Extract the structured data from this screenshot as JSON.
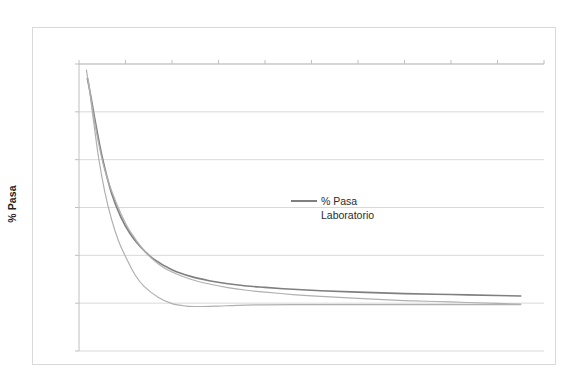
{
  "chart_data": {
    "type": "line",
    "title": "",
    "xlabel": "Diametro Tamiz (mm)",
    "ylabel": "% Pasa",
    "xlim": [
      0,
      10
    ],
    "ylim": [
      0,
      120
    ],
    "y_axis_inverted": true,
    "x_axis_position": "top",
    "grid": "horizontal",
    "legend_position": "center",
    "xticks": [
      "0",
      "1",
      "2",
      "3",
      "4",
      "5",
      "6",
      "7",
      "8",
      "9",
      "10"
    ],
    "yticks": [
      "0.0",
      "20.0",
      "40.0",
      "60.0",
      "80.0",
      "100.0",
      "120.0"
    ],
    "legend": [
      "% Pasa Laboratorio"
    ],
    "colors": {
      "series_main": "#7f7f7f",
      "series_envelope": "#b0b0b0",
      "grid": "#d9d9d9",
      "frame": "#d9d9d9",
      "text": "#2b2b2b"
    },
    "series": [
      {
        "name": "% Pasa Laboratorio",
        "style": "solid-dark",
        "x": [
          0.18,
          0.25,
          0.35,
          0.5,
          0.7,
          0.9,
          1.1,
          1.3,
          1.6,
          2.0,
          2.4,
          2.8,
          3.2,
          3.6,
          4.0,
          4.6,
          5.2,
          6.0,
          7.0,
          8.0,
          9.0,
          9.5
        ],
        "y": [
          6.0,
          13.0,
          24.0,
          39.0,
          54.0,
          64.0,
          71.0,
          76.0,
          81.5,
          86.0,
          88.8,
          90.6,
          91.9,
          92.8,
          93.4,
          94.2,
          94.8,
          95.4,
          96.0,
          96.4,
          96.8,
          97.0
        ]
      },
      {
        "name": "envelope-upper",
        "style": "solid-light",
        "x": [
          0.16,
          0.22,
          0.3,
          0.42,
          0.55,
          0.7,
          0.9,
          1.1,
          1.4,
          1.7,
          2.0,
          2.4,
          2.8,
          3.2,
          3.6,
          4.0,
          4.6,
          5.2,
          6.0,
          7.0,
          8.0,
          9.0,
          9.5
        ],
        "y": [
          2.5,
          10.0,
          20.0,
          33.0,
          44.0,
          53.0,
          62.5,
          70.0,
          78.0,
          83.5,
          87.0,
          90.0,
          92.0,
          93.5,
          94.6,
          95.4,
          96.4,
          97.2,
          98.0,
          98.9,
          99.5,
          100.1,
          100.4
        ]
      },
      {
        "name": "envelope-lower",
        "style": "solid-light",
        "x": [
          0.2,
          0.3,
          0.42,
          0.55,
          0.7,
          0.85,
          1.0,
          1.2,
          1.4,
          1.7,
          2.0,
          2.3,
          2.6,
          3.0,
          3.4,
          4.0,
          4.6,
          5.2,
          6.0,
          7.0,
          8.0,
          9.0,
          9.5
        ],
        "y": [
          6.5,
          22.0,
          39.0,
          53.0,
          65.0,
          74.0,
          80.5,
          88.0,
          93.0,
          97.5,
          100.2,
          101.2,
          101.4,
          101.2,
          100.9,
          100.7,
          100.6,
          100.6,
          100.6,
          100.6,
          100.6,
          100.6,
          100.6
        ]
      }
    ]
  }
}
